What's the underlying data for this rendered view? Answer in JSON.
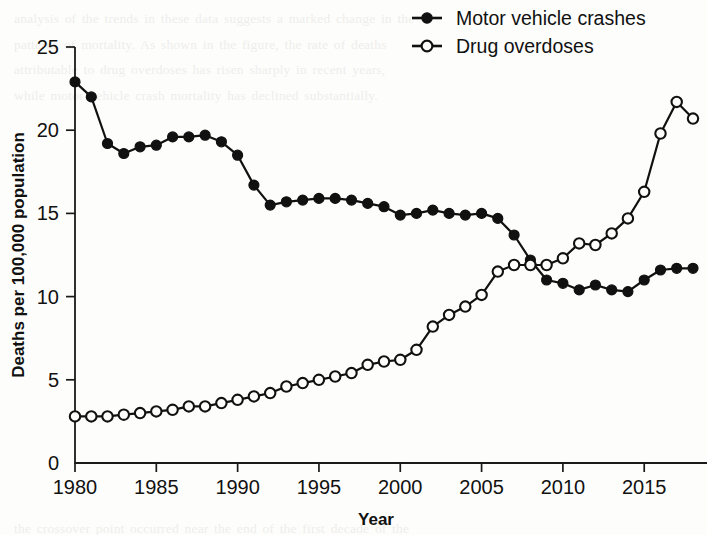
{
  "chart_data": {
    "type": "line",
    "title": "",
    "xlabel": "Year",
    "ylabel": "Deaths per 100,000 population",
    "xlim": [
      1980,
      2018
    ],
    "ylim": [
      0,
      25
    ],
    "xticks": [
      1980,
      1985,
      1990,
      1995,
      2000,
      2005,
      2010,
      2015
    ],
    "yticks": [
      0,
      5,
      10,
      15,
      20,
      25
    ],
    "xticklabels": [
      "1980",
      "1985",
      "1990",
      "1995",
      "2000",
      "2005",
      "2010",
      "2015"
    ],
    "yticklabels": [
      "0",
      "5",
      "10",
      "15",
      "20",
      "25"
    ],
    "grid": false,
    "legend_position": "top-right",
    "x": [
      1980,
      1981,
      1982,
      1983,
      1984,
      1985,
      1986,
      1987,
      1988,
      1989,
      1990,
      1991,
      1992,
      1993,
      1994,
      1995,
      1996,
      1997,
      1998,
      1999,
      2000,
      2001,
      2002,
      2003,
      2004,
      2005,
      2006,
      2007,
      2008,
      2009,
      2010,
      2011,
      2012,
      2013,
      2014,
      2015,
      2016,
      2017,
      2018
    ],
    "series": [
      {
        "name": "Motor vehicle crashes",
        "marker": "filled-circle",
        "color": "#111111",
        "values": [
          22.9,
          22.0,
          19.2,
          18.6,
          19.0,
          19.1,
          19.6,
          19.6,
          19.7,
          19.3,
          18.5,
          16.7,
          15.5,
          15.7,
          15.8,
          15.9,
          15.9,
          15.8,
          15.6,
          15.4,
          14.9,
          15.0,
          15.2,
          15.0,
          14.9,
          15.0,
          14.7,
          13.7,
          12.2,
          11.0,
          10.8,
          10.4,
          10.7,
          10.4,
          10.3,
          11.0,
          11.6,
          11.7,
          11.7
        ]
      },
      {
        "name": "Drug overdoses",
        "marker": "open-circle",
        "color": "#111111",
        "values": [
          2.8,
          2.8,
          2.8,
          2.9,
          3.0,
          3.1,
          3.2,
          3.4,
          3.4,
          3.6,
          3.8,
          4.0,
          4.2,
          4.6,
          4.8,
          5.0,
          5.2,
          5.4,
          5.9,
          6.1,
          6.2,
          6.8,
          8.2,
          8.9,
          9.4,
          10.1,
          11.5,
          11.9,
          11.9,
          11.9,
          12.3,
          13.2,
          13.1,
          13.8,
          14.7,
          16.3,
          19.8,
          21.7,
          20.7
        ]
      }
    ]
  },
  "legend": {
    "items": [
      {
        "label": "Motor vehicle crashes",
        "marker": "filled-circle"
      },
      {
        "label": "Drug overdoses",
        "marker": "open-circle"
      }
    ]
  },
  "background_text": {
    "lines": [
      "analysis of the trends in these data suggests a marked change in the",
      "patterns of mortality. As shown in the figure, the rate of deaths",
      "attributable to drug overdoses has risen sharply in recent years,",
      "while motor vehicle crash mortality has declined substantially.",
      "",
      "",
      "",
      "",
      "",
      "",
      "",
      "",
      "",
      "",
      "",
      "",
      "",
      "",
      "",
      "",
      "the crossover point occurred near the end of the first decade of the",
      "century, when the two curves met at approximately twelve deaths per",
      "one hundred thousand persons in the resident population."
    ]
  }
}
